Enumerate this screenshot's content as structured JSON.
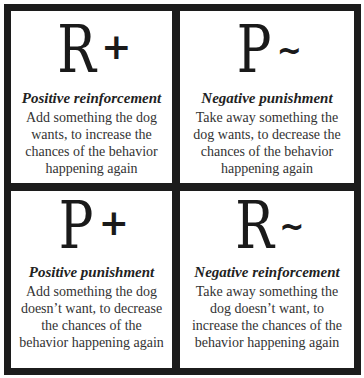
{
  "quadrants": [
    {
      "position": "top-left",
      "symbol_letter": "R",
      "symbol_operator": "+",
      "title": "Positive reinforcement",
      "description_lines": [
        "Add something the dog",
        "wants, to increase the",
        "chances of the behavior",
        "happening again"
      ]
    },
    {
      "position": "top-right",
      "symbol_letter": "P",
      "symbol_operator": "~",
      "title": "Negative punishment",
      "description_lines": [
        "Take away something the",
        "dog wants, to decrease the",
        "chances of the behavior",
        "happening again"
      ]
    },
    {
      "position": "bottom-left",
      "symbol_letter": "P",
      "symbol_operator": "+",
      "title": "Positive punishment",
      "description_lines": [
        "Add something the dog",
        "doesn’t want, to decrease",
        "the chances of the",
        "behavior happening again"
      ]
    },
    {
      "position": "bottom-right",
      "symbol_letter": "R",
      "symbol_operator": "~",
      "title": "Negative reinforcement",
      "description_lines": [
        "Take away something the",
        "dog doesn’t want, to",
        "increase the chances of the",
        "behavior happening again"
      ]
    }
  ],
  "colors": {
    "border": "#1c1c1c",
    "background": "#ffffff",
    "text": "#2a2a2a"
  }
}
